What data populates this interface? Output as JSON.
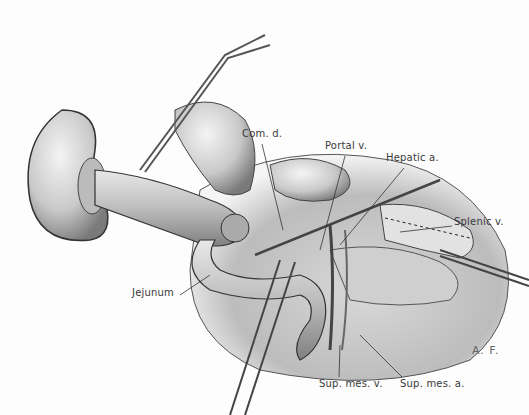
{
  "figure": {
    "type": "surgical illustration",
    "signature": "A. F.",
    "labels": [
      {
        "id": "com_d",
        "text": "Com. d.",
        "x": 242,
        "y": 134
      },
      {
        "id": "portal_v",
        "text": "Portal v.",
        "x": 325,
        "y": 146
      },
      {
        "id": "hepatic_a",
        "text": "Hepatic a.",
        "x": 386,
        "y": 158
      },
      {
        "id": "splenic_v",
        "text": "Splenic v.",
        "x": 454,
        "y": 222
      },
      {
        "id": "jejunum",
        "text": "Jejunum",
        "x": 132,
        "y": 293
      },
      {
        "id": "sup_mes_v",
        "text": "Sup. mes. v.",
        "x": 319,
        "y": 380
      },
      {
        "id": "sup_mes_a",
        "text": "Sup. mes. a.",
        "x": 400,
        "y": 380
      }
    ]
  }
}
